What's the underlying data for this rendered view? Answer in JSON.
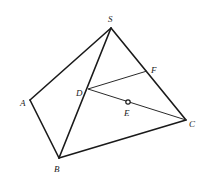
{
  "diagram": {
    "title": "",
    "points": {
      "S": {
        "label": "S",
        "x": 111,
        "y": 28,
        "lx": 108,
        "ly": 22
      },
      "A": {
        "label": "A",
        "x": 30,
        "y": 100,
        "lx": 20,
        "ly": 106
      },
      "B": {
        "label": "B",
        "x": 59,
        "y": 158,
        "lx": 54,
        "ly": 172
      },
      "C": {
        "label": "C",
        "x": 186,
        "y": 120,
        "lx": 189,
        "ly": 127
      },
      "D": {
        "label": "D",
        "x": 88,
        "y": 89,
        "lx": 76,
        "ly": 96
      },
      "E": {
        "label": "E",
        "x": 128,
        "y": 102,
        "lx": 124,
        "ly": 116
      },
      "F": {
        "label": "F",
        "x": 147,
        "y": 71,
        "lx": 151,
        "ly": 73
      }
    },
    "edges": [
      {
        "from": "S",
        "to": "A",
        "style": "thick"
      },
      {
        "from": "A",
        "to": "B",
        "style": "thick"
      },
      {
        "from": "B",
        "to": "C",
        "style": "thick"
      },
      {
        "from": "S",
        "to": "C",
        "style": "thick"
      },
      {
        "from": "S",
        "to": "B",
        "style": "thick"
      },
      {
        "from": "D",
        "to": "F",
        "style": "thin"
      },
      {
        "from": "D",
        "to": "C",
        "style": "thin"
      }
    ],
    "marked_point": "E"
  }
}
